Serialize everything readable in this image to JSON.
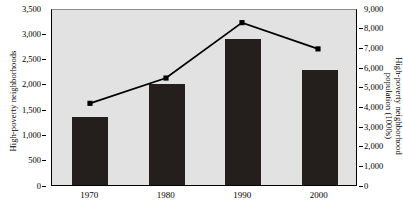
{
  "chart_data": {
    "type": "bar",
    "title": "",
    "xlabel": "",
    "categories": [
      "1970",
      "1980",
      "1990",
      "2000"
    ],
    "grid": false,
    "legend": "none",
    "series": [
      {
        "name": "High-poverty neighborhoods",
        "type": "bar",
        "axis": "left",
        "ylabel": "High-poverty neighborhoods",
        "ylim": [
          0,
          3500
        ],
        "yticks": [
          0,
          500,
          1000,
          1500,
          2000,
          2500,
          3000,
          3500
        ],
        "ytick_labels": [
          "0",
          "500",
          "1,000",
          "1,500",
          "2,000",
          "2,500",
          "3,000",
          "3,500"
        ],
        "values": [
          1350,
          2000,
          2880,
          2280
        ],
        "color": "#241f1d"
      },
      {
        "name": "High-poverty neighborhood population (1000s)",
        "type": "line",
        "axis": "right",
        "ylabel": "High-poverty neighborhood population (1000s)",
        "ylim": [
          0,
          9000
        ],
        "yticks": [
          0,
          1000,
          2000,
          3000,
          4000,
          5000,
          6000,
          7000,
          8000,
          9000
        ],
        "ytick_labels": [
          "0",
          "1,000",
          "2,000",
          "3,000",
          "4,000",
          "5,000",
          "6,000",
          "7,000",
          "8,000",
          "9,000"
        ],
        "values": [
          4200,
          5500,
          8350,
          7000
        ],
        "color": "#000000",
        "marker": "square"
      }
    ],
    "plot_background": "#e2e2e2"
  }
}
